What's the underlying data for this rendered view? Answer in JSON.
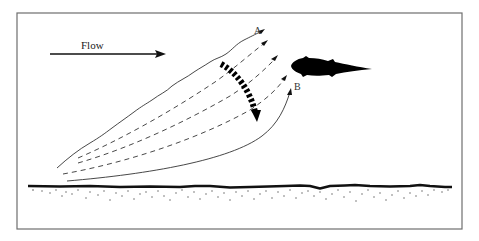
{
  "diagram": {
    "flow_label": "Flow",
    "point_a_label": "A",
    "point_b_label": "B",
    "elements": {
      "flow_arrow": "arrow-right-icon",
      "fish": "fish-icon",
      "streamlines": "streamline-set",
      "motion_arrow": "segmented-curved-arrow-icon",
      "substrate": "sediment-bed"
    },
    "colors": {
      "ink": "#111111",
      "frame": "#6e6e6e",
      "background": "#ffffff"
    }
  }
}
